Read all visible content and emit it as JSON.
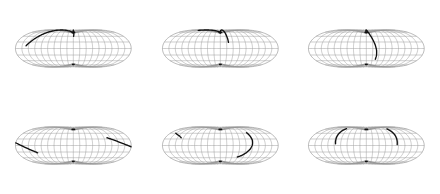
{
  "figure": {
    "title": "",
    "background_color": "#ffffff",
    "width": 440,
    "height": 194,
    "panel_rows": 2,
    "panel_cols": 3,
    "panel_count": 6
  },
  "style": {
    "graticule_color": "#9a9a9a",
    "outline_color": "#8a8a8a",
    "track_color": "#101010",
    "graticule_stroke_width": 0.5,
    "track_stroke_width": 1.35
  },
  "chart_data": {
    "type": "line",
    "title": "",
    "xlabel": "",
    "ylabel": "",
    "projection": "sinusoidal",
    "lon_range": [
      -180,
      180
    ],
    "lat_range": [
      -90,
      90
    ],
    "graticule": {
      "meridian_step_deg": 20,
      "parallel_step_deg": 15,
      "meridians_lon": [
        -180,
        -160,
        -140,
        -120,
        -100,
        -80,
        -60,
        -40,
        -20,
        0,
        20,
        40,
        60,
        80,
        100,
        120,
        140,
        160,
        180
      ],
      "parallels_lat": [
        -75,
        -60,
        -45,
        -30,
        -15,
        0,
        15,
        30,
        45,
        60,
        75
      ]
    },
    "panels": [
      {
        "id": "panel-1",
        "row": 1,
        "col": 1,
        "label": "",
        "tracks": [
          {
            "name": "track-a",
            "points_lonlat": [
              [
                -148,
                6
              ],
              [
                -140,
                14
              ],
              [
                -130,
                24
              ],
              [
                -120,
                35
              ],
              [
                -108,
                48
              ],
              [
                -92,
                62
              ],
              [
                -70,
                76
              ],
              [
                -40,
                86
              ],
              [
                -8,
                89
              ]
            ]
          },
          {
            "name": "track-b",
            "points_lonlat": [
              [
                -6,
                89
              ],
              [
                -2,
                80
              ],
              [
                0,
                70
              ],
              [
                1,
                58
              ],
              [
                2,
                46
              ],
              [
                2,
                36
              ],
              [
                1,
                30
              ]
            ]
          }
        ]
      },
      {
        "id": "panel-2",
        "row": 1,
        "col": 2,
        "label": "",
        "tracks": [
          {
            "name": "track-a",
            "points_lonlat": [
              [
                -126,
                57
              ],
              [
                -112,
                62
              ],
              [
                -96,
                68
              ],
              [
                -76,
                74
              ],
              [
                -54,
                80
              ],
              [
                -30,
                85
              ],
              [
                -10,
                88
              ]
            ]
          },
          {
            "name": "track-b",
            "points_lonlat": [
              [
                -6,
                89
              ],
              [
                4,
                76
              ],
              [
                12,
                62
              ],
              [
                18,
                48
              ],
              [
                22,
                34
              ],
              [
                25,
                22
              ],
              [
                26,
                14
              ]
            ]
          }
        ]
      },
      {
        "id": "panel-3",
        "row": 1,
        "col": 3,
        "label": "",
        "tracks": [
          {
            "name": "track-a",
            "points_lonlat": [
              [
                -12,
                88
              ],
              [
                -6,
                76
              ],
              [
                0,
                62
              ],
              [
                6,
                48
              ],
              [
                14,
                34
              ],
              [
                22,
                20
              ],
              [
                28,
                8
              ],
              [
                32,
                -4
              ],
              [
                33,
                -16
              ],
              [
                31,
                -26
              ]
            ]
          }
        ]
      },
      {
        "id": "panel-4",
        "row": 2,
        "col": 1,
        "label": "",
        "tracks": [
          {
            "name": "track-a",
            "points_lonlat": [
              [
                -180,
                6
              ],
              [
                -168,
                2
              ],
              [
                -154,
                -3
              ],
              [
                -140,
                -8
              ],
              [
                -126,
                -13
              ],
              [
                -116,
                -17
              ]
            ]
          },
          {
            "name": "track-b",
            "points_lonlat": [
              [
                110,
                18
              ],
              [
                124,
                14
              ],
              [
                140,
                9
              ],
              [
                156,
                4
              ],
              [
                170,
                0
              ],
              [
                180,
                -3
              ]
            ]
          }
        ]
      },
      {
        "id": "panel-5",
        "row": 2,
        "col": 2,
        "label": "",
        "tracks": [
          {
            "name": "track-a",
            "points_lonlat": [
              [
                -160,
                30
              ],
              [
                -148,
                26
              ],
              [
                -136,
                22
              ],
              [
                -128,
                18
              ]
            ]
          },
          {
            "name": "track-b",
            "points_lonlat": [
              [
                96,
                32
              ],
              [
                100,
                22
              ],
              [
                102,
                12
              ],
              [
                100,
                2
              ],
              [
                94,
                -8
              ],
              [
                84,
                -17
              ],
              [
                72,
                -24
              ],
              [
                60,
                -28
              ]
            ]
          }
        ]
      },
      {
        "id": "panel-6",
        "row": 2,
        "col": 3,
        "label": "",
        "tracks": [
          {
            "name": "track-a",
            "points_lonlat": [
              [
                -92,
                48
              ],
              [
                -96,
                38
              ],
              [
                -98,
                28
              ],
              [
                -98,
                18
              ],
              [
                -97,
                10
              ],
              [
                -96,
                4
              ]
            ]
          },
          {
            "name": "track-b",
            "points_lonlat": [
              [
                92,
                46
              ],
              [
                96,
                36
              ],
              [
                98,
                26
              ],
              [
                98,
                16
              ],
              [
                97,
                8
              ],
              [
                96,
                2
              ]
            ]
          }
        ]
      }
    ]
  }
}
